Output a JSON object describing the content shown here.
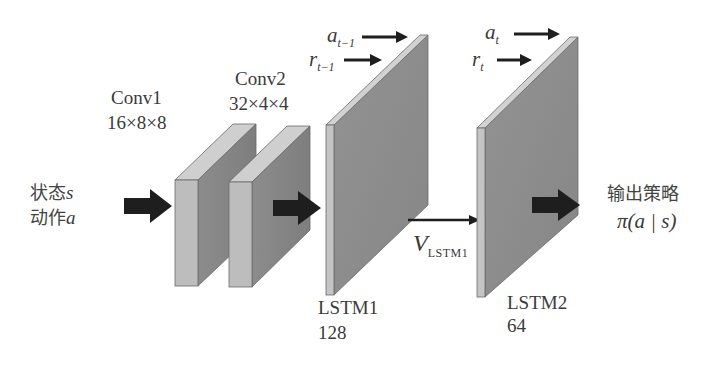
{
  "diagram": {
    "type": "neural-network-architecture",
    "input": {
      "line1_cjk": "状态",
      "line1_var": "s",
      "line2_cjk": "动作",
      "line2_var": "a"
    },
    "layers": [
      {
        "id": "conv1",
        "name": "Conv1",
        "size": "16×8×8"
      },
      {
        "id": "conv2",
        "name": "Conv2",
        "size": "32×4×4"
      },
      {
        "id": "lstm1",
        "name": "LSTM1",
        "size": "128",
        "inputs": [
          {
            "var": "a",
            "sub": "t−1"
          },
          {
            "var": "r",
            "sub": "t−1"
          }
        ]
      },
      {
        "id": "lstm2",
        "name": "LSTM2",
        "size": "64",
        "inputs": [
          {
            "var": "a",
            "sub": "t"
          },
          {
            "var": "r",
            "sub": "t"
          }
        ]
      }
    ],
    "connection": {
      "var": "V",
      "sub": "LSTM1"
    },
    "output": {
      "label_cjk": "输出策略",
      "formula": "π(a | s)"
    },
    "colors": {
      "front_face": "#bdbdbd",
      "top_face": "#cfcfcf",
      "side_face": "#8a8a8a",
      "panel_face": "#8e8e8e",
      "panel_edge": "#c4c4c4",
      "arrow": "#1e1e1e",
      "outline": "#5a5a5a"
    }
  }
}
